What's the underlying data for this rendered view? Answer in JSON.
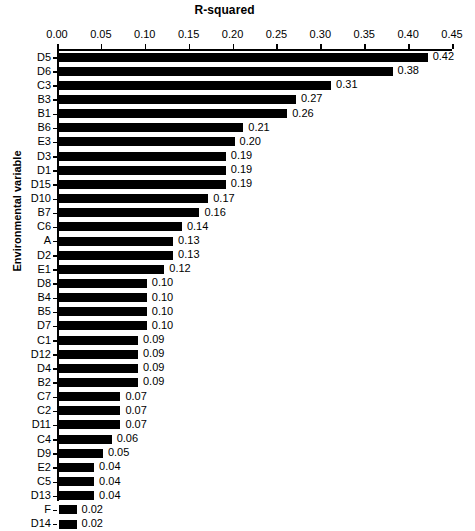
{
  "chart_data": {
    "type": "bar",
    "orientation": "horizontal",
    "title": "R-squared",
    "xlabel": "R-squared",
    "ylabel": "Environmental variable",
    "xlim": [
      0.0,
      0.45
    ],
    "xticks": [
      "0.00",
      "0.05",
      "0.10",
      "0.15",
      "0.20",
      "0.25",
      "0.30",
      "0.35",
      "0.40",
      "0.45"
    ],
    "xtick_values": [
      0.0,
      0.05,
      0.1,
      0.15,
      0.2,
      0.25,
      0.3,
      0.35,
      0.4,
      0.45
    ],
    "grid": false,
    "legend": "none",
    "bar_color": "#000000",
    "categories": [
      "D5",
      "D6",
      "C3",
      "B3",
      "B1",
      "B6",
      "E3",
      "D3",
      "D1",
      "D15",
      "D10",
      "B7",
      "C6",
      "A",
      "D2",
      "E1",
      "D8",
      "B4",
      "B5",
      "D7",
      "C1",
      "D12",
      "D4",
      "B2",
      "C7",
      "C2",
      "D11",
      "C4",
      "D9",
      "E2",
      "C5",
      "D13",
      "F",
      "D14"
    ],
    "values": [
      0.42,
      0.38,
      0.31,
      0.27,
      0.26,
      0.21,
      0.2,
      0.19,
      0.19,
      0.19,
      0.17,
      0.16,
      0.14,
      0.13,
      0.13,
      0.12,
      0.1,
      0.1,
      0.1,
      0.1,
      0.09,
      0.09,
      0.09,
      0.09,
      0.07,
      0.07,
      0.07,
      0.06,
      0.05,
      0.04,
      0.04,
      0.04,
      0.02,
      0.02
    ],
    "value_labels": [
      "0.42",
      "0.38",
      "0.31",
      "0.27",
      "0.26",
      "0.21",
      "0.20",
      "0.19",
      "0.19",
      "0.19",
      "0.17",
      "0.16",
      "0.14",
      "0.13",
      "0.13",
      "0.12",
      "0.10",
      "0.10",
      "0.10",
      "0.10",
      "0.09",
      "0.09",
      "0.09",
      "0.09",
      "0.07",
      "0.07",
      "0.07",
      "0.06",
      "0.05",
      "0.04",
      "0.04",
      "0.04",
      "0.02",
      "0.02"
    ]
  }
}
